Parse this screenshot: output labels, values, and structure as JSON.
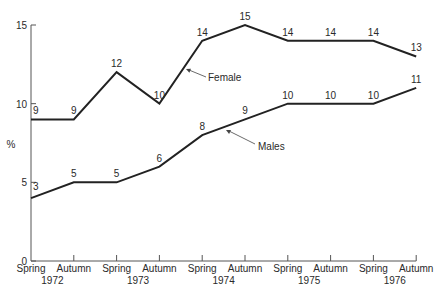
{
  "chart_data": {
    "type": "line",
    "title": "",
    "xlabel": "",
    "ylabel": "%",
    "ylim": [
      0,
      15
    ],
    "yticks": [
      0,
      5,
      10,
      15
    ],
    "grid": false,
    "legend_position": "inline-annotations",
    "categories": [
      "Spring 1972",
      "Autumn 1972",
      "Spring 1973",
      "Autumn 1973",
      "Spring 1974",
      "Autumn 1974",
      "Spring 1975",
      "Autumn 1975",
      "Spring 1976",
      "Autumn 1976"
    ],
    "x_season_labels": [
      "Spring",
      "Autumn",
      "Spring",
      "Autumn",
      "Spring",
      "Autumn",
      "Spring",
      "Autumn",
      "Spring",
      "Autumn"
    ],
    "x_year_labels": [
      "1972",
      "1973",
      "1974",
      "1975",
      "1976"
    ],
    "series": [
      {
        "name": "Female",
        "values": [
          9,
          9,
          12,
          10,
          14,
          15,
          14,
          14,
          14,
          13
        ],
        "point_labels": [
          "9",
          "9",
          "12",
          "10",
          "14",
          "15",
          "14",
          "14",
          "14",
          "13"
        ],
        "annotation": "Female"
      },
      {
        "name": "Males",
        "values": [
          4,
          5,
          5,
          6,
          8,
          9,
          10,
          10,
          10,
          11
        ],
        "point_labels": [
          "3",
          "5",
          "5",
          "6",
          "8",
          "9",
          "10",
          "10",
          "10",
          "11"
        ],
        "annotation": "Males"
      }
    ]
  }
}
